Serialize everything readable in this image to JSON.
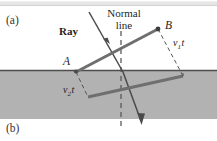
{
  "figure": {
    "panel_a_label": "(a)",
    "panel_b_label": "(b)",
    "ray_label": "Ray",
    "normal_label_line1": "Normal",
    "normal_label_line2": "line",
    "point_a_label": "A",
    "point_b_label": "B",
    "v1t_symbol": "v",
    "v1t_subscript": "1",
    "v1t_time": "t",
    "v2t_symbol": "v",
    "v2t_subscript": "2",
    "v2t_time": "t",
    "medium_fill_color": "#b0b0b0",
    "top_band_color": "#e3e3e3",
    "line_color": "#555555",
    "wavefront_color": "#6b6b6b",
    "interface_color": "#4a4a4a",
    "background_color": "#ffffff"
  }
}
